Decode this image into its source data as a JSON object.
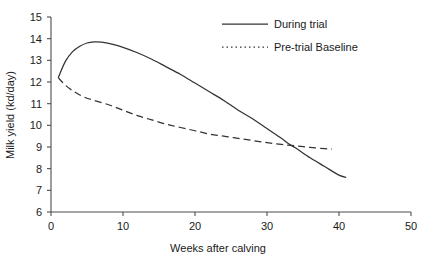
{
  "chart_data": {
    "type": "line",
    "title": "",
    "xlabel": "Weeks after calving",
    "ylabel": "Milk yield (kd/day)",
    "xlim": [
      0,
      50
    ],
    "ylim": [
      6,
      15
    ],
    "xticks": [
      0,
      10,
      20,
      30,
      40,
      50
    ],
    "yticks": [
      6,
      7,
      8,
      9,
      10,
      11,
      12,
      13,
      14,
      15
    ],
    "xtick_labels": [
      "0",
      "10",
      "20",
      "30",
      "40",
      "50"
    ],
    "ytick_labels": [
      "6",
      "7",
      "8",
      "9",
      "10",
      "11",
      "12",
      "13",
      "14",
      "15"
    ],
    "grid": false,
    "legend_position": "top-right",
    "series": [
      {
        "name": "During trial",
        "style": "solid",
        "color": "#333333",
        "x": [
          1,
          2,
          3,
          4,
          5,
          6,
          7,
          8,
          10,
          12,
          14,
          16,
          18,
          20,
          22,
          24,
          26,
          28,
          30,
          32,
          33,
          34,
          36,
          38,
          40,
          41
        ],
        "values": [
          12.2,
          12.95,
          13.4,
          13.65,
          13.8,
          13.85,
          13.84,
          13.78,
          13.6,
          13.35,
          13.05,
          12.7,
          12.35,
          11.95,
          11.55,
          11.15,
          10.7,
          10.3,
          9.85,
          9.4,
          9.15,
          8.95,
          8.5,
          8.1,
          7.7,
          7.6
        ]
      },
      {
        "name": "Pre-trial Baseline",
        "style": "dashed",
        "color": "#333333",
        "x": [
          1,
          2,
          3,
          4,
          5,
          6,
          8,
          10,
          12,
          14,
          16,
          18,
          20,
          22,
          24,
          26,
          28,
          30,
          32,
          34,
          36,
          38,
          39
        ],
        "values": [
          12.2,
          11.85,
          11.6,
          11.4,
          11.25,
          11.15,
          10.95,
          10.7,
          10.45,
          10.25,
          10.05,
          9.9,
          9.75,
          9.6,
          9.5,
          9.4,
          9.3,
          9.2,
          9.12,
          9.05,
          8.98,
          8.92,
          8.9
        ]
      }
    ],
    "legend_entries": [
      {
        "label": "During trial",
        "style": "solid"
      },
      {
        "label": "Pre-trial Baseline",
        "style": "dotted"
      }
    ]
  }
}
